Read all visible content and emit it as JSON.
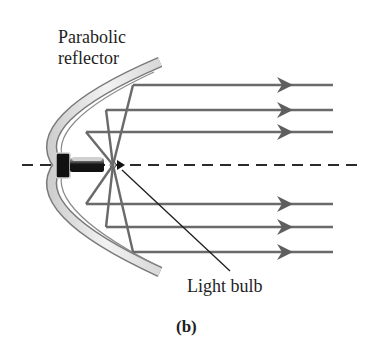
{
  "figure": {
    "panel_label": "(b)",
    "labels": {
      "reflector_line1": "Parabolic",
      "reflector_line2": "reflector",
      "bulb": "Light bulb"
    },
    "colors": {
      "ray": "#6a6a6a",
      "axis": "#2a2a2a",
      "mirror_outline": "#7a7a7a",
      "mirror_fill": "#e4e4e4",
      "bulb_base": "#111111",
      "text": "#1e1e1e",
      "background": "#ffffff"
    },
    "optical_axis": {
      "style": "dashed",
      "y": 165,
      "x_start": 22,
      "x_end": 358
    },
    "focal_point": {
      "x": 113,
      "y": 165
    },
    "rays": [
      {
        "reflect_x": 133,
        "y": 85,
        "end_x": 333
      },
      {
        "reflect_x": 106,
        "y": 110,
        "end_x": 333
      },
      {
        "reflect_x": 86,
        "y": 132,
        "end_x": 333
      },
      {
        "reflect_x": 86,
        "y": 204,
        "end_x": 333
      },
      {
        "reflect_x": 106,
        "y": 227,
        "end_x": 333
      },
      {
        "reflect_x": 133,
        "y": 252,
        "end_x": 333
      }
    ],
    "ray_count": 6,
    "arrow_direction": "right"
  }
}
